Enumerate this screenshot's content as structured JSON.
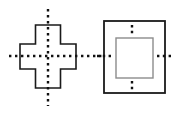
{
  "canvas": {
    "width": 175,
    "height": 115,
    "background": "#ffffff",
    "title": "Lines of symmetry figures"
  },
  "palette": {
    "outline_dark": "#1a1a1a",
    "outline_gray": "#8c8c8c",
    "dotted": "#111111",
    "fill": "#ffffff"
  },
  "chart_data": {
    "type": "diagram",
    "figures": [
      {
        "name": "cross",
        "label": "plus-shape",
        "shape": "cross",
        "bounds": {
          "x": 20,
          "y": 25,
          "width": 56,
          "height": 63
        },
        "arm_thickness": 25,
        "stroke": "#1a1a1a",
        "stroke_width": 1.6,
        "fill": "#ffffff",
        "symmetry_lines": [
          {
            "orientation": "vertical",
            "x": 48,
            "y1": 9,
            "y2": 106,
            "style": "dotted"
          },
          {
            "orientation": "horizontal",
            "y": 56,
            "x1": 9,
            "x2": 100,
            "style": "dotted"
          }
        ]
      },
      {
        "name": "nested-squares",
        "label": "square-in-square",
        "shape": "square",
        "outer": {
          "x": 104,
          "y": 21,
          "width": 61,
          "height": 72,
          "stroke": "#1a1a1a",
          "stroke_width": 1.8,
          "fill": "#ffffff"
        },
        "inner": {
          "x": 116,
          "y": 38,
          "width": 37,
          "height": 40,
          "stroke": "#8c8c8c",
          "stroke_width": 1.4,
          "fill": "#ffffff"
        },
        "symmetry_lines": [
          {
            "orientation": "vertical",
            "x": 132,
            "segments": [
              [
                25,
                35
              ],
              [
                81,
                91
              ]
            ],
            "style": "dotted"
          },
          {
            "orientation": "horizontal",
            "y": 56,
            "segments": [
              [
                97,
                113
              ],
              [
                157,
                172
              ]
            ],
            "style": "dotted"
          }
        ]
      }
    ],
    "connector": {
      "orientation": "horizontal",
      "y": 56,
      "x1": 76,
      "x2": 104,
      "style": "dotted",
      "note": "dotted axis continues from cross to square"
    }
  }
}
